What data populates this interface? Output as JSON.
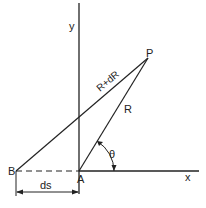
{
  "diagram": {
    "labels": {
      "y_axis": "y",
      "x_axis": "x",
      "point_p": "P",
      "point_a": "A",
      "point_b": "B",
      "segment_bp": "R+dR",
      "segment_ap": "R",
      "angle": "θ",
      "distance_ba": "ds"
    },
    "colors": {
      "line": "#222222",
      "background": "#ffffff"
    }
  }
}
